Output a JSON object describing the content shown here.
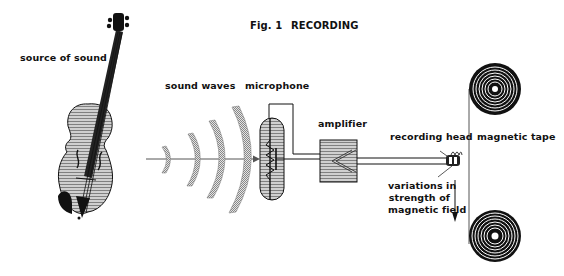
{
  "figure": {
    "number_label": "Fig. 1",
    "title": "RECORDING"
  },
  "labels": {
    "source": "source of sound",
    "waves": "sound waves",
    "microphone": "microphone",
    "amplifier": "amplifier",
    "recording_head": "recording head",
    "tape": "magnetic tape",
    "variations_line1": "variations in",
    "variations_line2": "strength of",
    "variations_line3": "magnetic field"
  },
  "colors": {
    "ink": "#111111",
    "fill_gray": "#b8b8b8",
    "background": "#ffffff"
  }
}
